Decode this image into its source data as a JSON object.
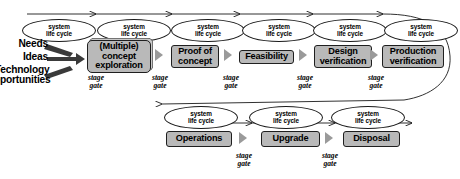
{
  "diagram": {
    "colors": {
      "box_fill": "#b9b9b9",
      "box_stroke": "#1f1f1f",
      "gate_arrow": "#9a9a9a",
      "line": "#1a1a1a",
      "background": "#ffffff"
    },
    "lifecycle_label_line1": "system",
    "lifecycle_label_line2": "life cycle",
    "stage_gate_line1": "stage",
    "stage_gate_line2": "gate",
    "inputs": [
      {
        "label": "Needs"
      },
      {
        "label": "Ideas"
      },
      {
        "label": "Technology"
      },
      {
        "label": "pportunities"
      }
    ],
    "top_row": {
      "stages": [
        {
          "label": "(Multiple)\nconcept\nexploration"
        },
        {
          "label": "Proof of\nconcept"
        },
        {
          "label": "Feasibility"
        },
        {
          "label": "Design\nverification"
        },
        {
          "label": "Production\nverification"
        }
      ],
      "lifecycle_count": 6,
      "gate_count": 5
    },
    "bottom_row": {
      "stages": [
        {
          "label": "Operations"
        },
        {
          "label": "Upgrade"
        },
        {
          "label": "Disposal"
        }
      ],
      "lifecycle_count": 3,
      "gate_count": 2
    }
  }
}
